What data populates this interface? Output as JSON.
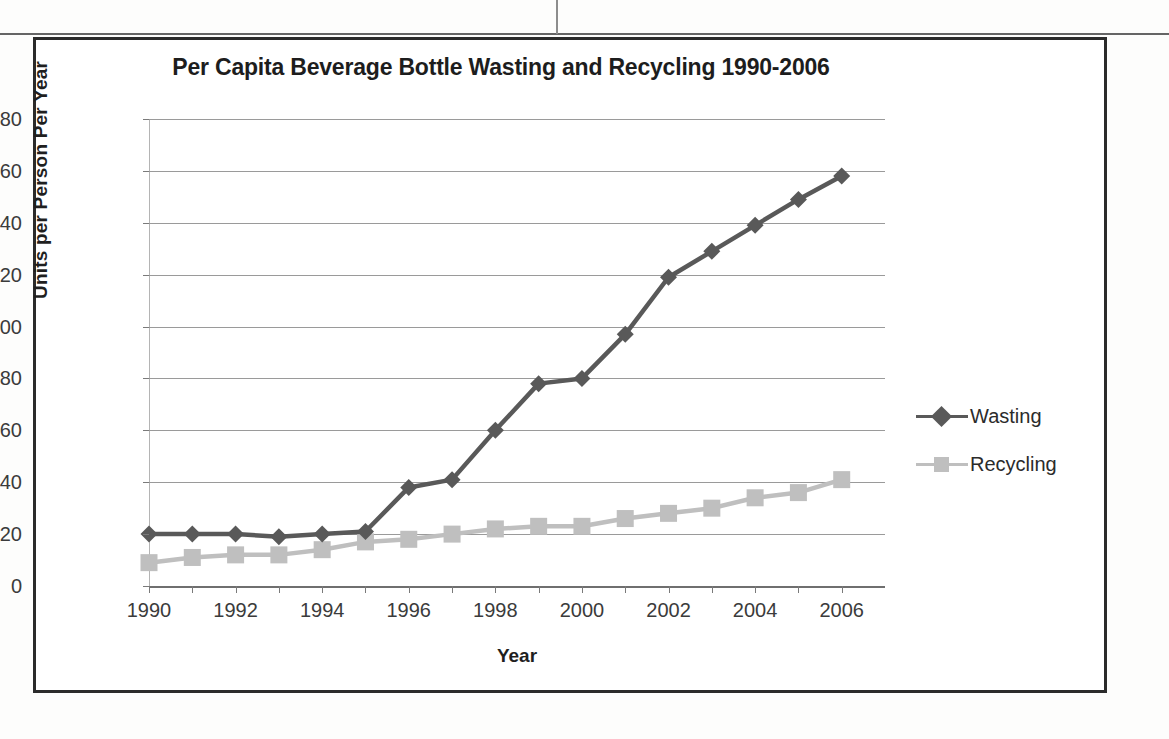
{
  "chart_data": {
    "type": "line",
    "title": "Per Capita Beverage Bottle Wasting and Recycling 1990-2006",
    "xlabel": "Year",
    "ylabel": "Units per Person Per Year",
    "x": [
      1990,
      1991,
      1992,
      1993,
      1994,
      1995,
      1996,
      1997,
      1998,
      1999,
      2000,
      2001,
      2002,
      2003,
      2004,
      2005,
      2006
    ],
    "x_tick_labels": [
      "1990",
      "1992",
      "1994",
      "1996",
      "1998",
      "2000",
      "2002",
      "2004",
      "2006"
    ],
    "y_tick_labels": [
      "0",
      "20",
      "40",
      "60",
      "80",
      "100",
      "120",
      "140",
      "160",
      "180"
    ],
    "ylim": [
      0,
      180
    ],
    "y_tick_step": 20,
    "xlim": [
      1990,
      2007
    ],
    "grid": "horizontal",
    "legend_position": "right",
    "series": [
      {
        "name": "Wasting",
        "marker": "diamond",
        "color": "#595959",
        "values": [
          20,
          20,
          20,
          19,
          20,
          21,
          38,
          41,
          60,
          78,
          80,
          97,
          119,
          129,
          139,
          149,
          158
        ]
      },
      {
        "name": "Recycling",
        "marker": "square",
        "color": "#bfbfbf",
        "values": [
          9,
          11,
          12,
          12,
          14,
          17,
          18,
          20,
          22,
          23,
          23,
          26,
          28,
          30,
          34,
          36,
          41
        ]
      }
    ]
  },
  "legend": {
    "items": [
      {
        "label": "Wasting"
      },
      {
        "label": "Recycling"
      }
    ]
  }
}
